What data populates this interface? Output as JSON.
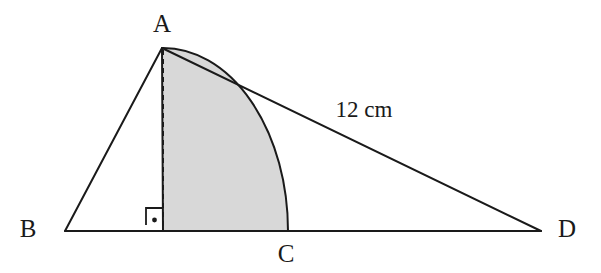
{
  "figure": {
    "background_color": "#ffffff",
    "stroke_color": "#1a1a1a",
    "shade_color": "#d8d8d8",
    "labels": {
      "vertex_a": "A",
      "vertex_b": "B",
      "vertex_c": "C",
      "vertex_d": "D",
      "side_ad_measure": "12 cm"
    },
    "label_positions": {
      "vertex_a": {
        "x": 162,
        "y": 32
      },
      "vertex_b": {
        "x": 28,
        "y": 237
      },
      "vertex_c": {
        "x": 286,
        "y": 262
      },
      "vertex_d": {
        "x": 567,
        "y": 237
      },
      "side_ad_measure": {
        "x": 364,
        "y": 117
      }
    },
    "points": {
      "a": {
        "x": 162,
        "y": 48
      },
      "b": {
        "x": 65,
        "y": 231
      },
      "c": {
        "x": 288,
        "y": 231
      },
      "d": {
        "x": 541,
        "y": 231
      },
      "foot": {
        "x": 163,
        "y": 231
      }
    },
    "segments": [
      {
        "name": "segment-ba",
        "from": "b",
        "to": "a",
        "style": "solid"
      },
      {
        "name": "segment-ad",
        "from": "a",
        "to": "d",
        "style": "solid"
      },
      {
        "name": "segment-bd",
        "from": "b",
        "to": "d",
        "style": "solid"
      },
      {
        "name": "altitude-a-foot",
        "from": "a",
        "to": "foot",
        "style": "dashed"
      }
    ],
    "sector": {
      "name": "shaded-sector",
      "center": {
        "x": 163,
        "y": 231
      },
      "radius_x": 125,
      "radius_y": 183,
      "start": {
        "x": 162,
        "y": 48
      },
      "end": {
        "x": 288,
        "y": 231
      },
      "fill": "#d8d8d8",
      "stroke": "#1a1a1a"
    },
    "right_angle_marker": {
      "name": "right-angle-marker",
      "x": 146,
      "y": 208,
      "size": 17,
      "dot_radius": 2.4
    },
    "stroke_widths": {
      "line": 2.0,
      "arc": 2.0,
      "marker": 1.8,
      "dash_pattern": "5 4"
    }
  }
}
